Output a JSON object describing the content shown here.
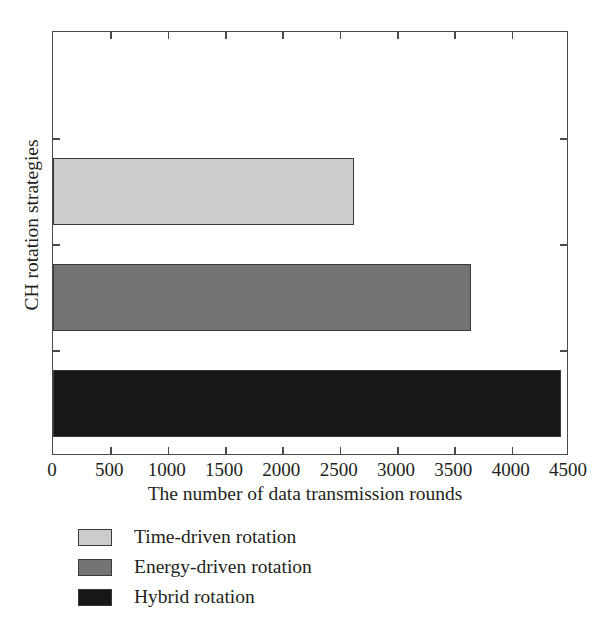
{
  "chart_data": {
    "type": "bar",
    "orientation": "horizontal",
    "title": "",
    "xlabel": "The number of data transmission rounds",
    "ylabel": "CH rotation strategies",
    "categories": [
      "Time-driven rotation",
      "Energy-driven rotation",
      "Hybrid rotation"
    ],
    "values": [
      2625,
      3645,
      4430
    ],
    "xlim": [
      0,
      4500
    ],
    "xticks": [
      0,
      500,
      1000,
      1500,
      2000,
      2500,
      3000,
      3500,
      4000,
      4500
    ],
    "xticklabels": [
      "0",
      "500",
      "1000",
      "1500",
      "2000",
      "2500",
      "3000",
      "3500",
      "4000",
      "4500"
    ],
    "yticklabels": [],
    "grid": false,
    "legend_position": "below-axes-left",
    "series": [
      {
        "name": "Time-driven rotation",
        "value": 2625,
        "color": "#cccccc"
      },
      {
        "name": "Energy-driven rotation",
        "value": 3645,
        "color": "#737373"
      },
      {
        "name": "Hybrid rotation",
        "value": 4430,
        "color": "#171717"
      }
    ],
    "colors": {
      "time_driven": "#cccccc",
      "energy_driven": "#737373",
      "hybrid": "#171717",
      "axis": "#4a4a4a",
      "text": "#231f20",
      "background": "#ffffff"
    }
  },
  "legend": {
    "items": [
      {
        "label": "Time-driven rotation",
        "color": "#cccccc"
      },
      {
        "label": "Energy-driven rotation",
        "color": "#737373"
      },
      {
        "label": "Hybrid rotation",
        "color": "#171717"
      }
    ]
  }
}
